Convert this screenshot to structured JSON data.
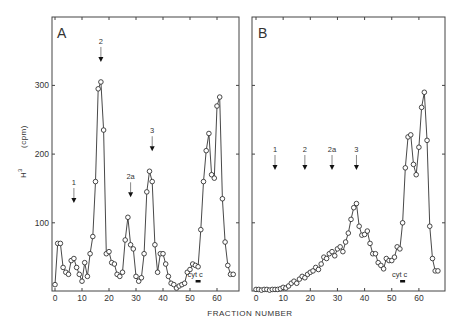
{
  "chart_data": [
    {
      "type": "line",
      "panel": "A",
      "xlabel": "FRACTION NUMBER",
      "ylabel": "H³ (cpm)",
      "xlim": [
        0,
        68.5
      ],
      "ylim": [
        0,
        400
      ],
      "xticks": [
        0,
        10,
        20,
        30,
        40,
        50,
        60
      ],
      "yticks": [
        100,
        200,
        300
      ],
      "grid": false,
      "x": [
        0,
        1,
        2,
        3,
        4,
        5,
        6,
        7,
        8,
        9,
        10,
        11,
        12,
        13,
        14,
        15,
        16,
        17,
        18,
        19,
        20,
        21,
        22,
        23,
        24,
        25,
        26,
        27,
        28,
        29,
        30,
        31,
        32,
        33,
        34,
        35,
        36,
        37,
        38,
        39,
        40,
        41,
        42,
        43,
        44,
        45,
        46,
        47,
        48,
        49,
        50,
        51,
        52,
        53,
        54,
        55,
        56,
        57,
        58,
        59,
        60,
        61,
        62,
        63,
        64,
        65,
        66
      ],
      "values": [
        10,
        70,
        70,
        35,
        28,
        25,
        45,
        48,
        35,
        25,
        15,
        42,
        22,
        55,
        80,
        160,
        295,
        305,
        235,
        55,
        58,
        42,
        40,
        25,
        22,
        28,
        75,
        108,
        68,
        62,
        22,
        15,
        20,
        55,
        145,
        175,
        160,
        68,
        28,
        55,
        55,
        40,
        22,
        12,
        10,
        5,
        8,
        10,
        12,
        28,
        32,
        40,
        38,
        36,
        90,
        160,
        205,
        230,
        170,
        165,
        270,
        283,
        135,
        72,
        38,
        25,
        25
      ],
      "markers": [
        {
          "label": "1",
          "fraction": 7,
          "style": "arrow"
        },
        {
          "label": "2",
          "fraction": 17,
          "style": "arrow"
        },
        {
          "label": "2a",
          "fraction": 28,
          "style": "arrow"
        },
        {
          "label": "3",
          "fraction": 36,
          "style": "arrow"
        },
        {
          "label": "cyt c",
          "fraction": 53,
          "style": "bar"
        }
      ]
    },
    {
      "type": "line",
      "panel": "B",
      "xlabel": "FRACTION NUMBER",
      "ylabel": "H³ (cpm)",
      "xlim": [
        0,
        70
      ],
      "ylim": [
        0,
        400
      ],
      "xticks": [
        0,
        10,
        20,
        30,
        40,
        50,
        60
      ],
      "yticks": [
        100,
        200,
        300
      ],
      "grid": false,
      "x": [
        0,
        1,
        2,
        3,
        4,
        5,
        6,
        7,
        8,
        9,
        10,
        11,
        12,
        13,
        14,
        15,
        16,
        17,
        18,
        19,
        20,
        21,
        22,
        23,
        24,
        25,
        26,
        27,
        28,
        29,
        30,
        31,
        32,
        33,
        34,
        35,
        36,
        37,
        38,
        39,
        40,
        41,
        42,
        43,
        44,
        45,
        46,
        47,
        48,
        49,
        50,
        51,
        52,
        53,
        54,
        55,
        56,
        57,
        58,
        59,
        60,
        61,
        62,
        63,
        64,
        65,
        66,
        67
      ],
      "values": [
        3,
        3,
        2,
        3,
        3,
        2,
        3,
        3,
        3,
        4,
        6,
        5,
        8,
        12,
        15,
        12,
        18,
        22,
        20,
        25,
        28,
        30,
        35,
        32,
        40,
        50,
        48,
        55,
        58,
        52,
        62,
        65,
        58,
        72,
        85,
        105,
        122,
        128,
        95,
        82,
        83,
        88,
        70,
        55,
        55,
        42,
        38,
        33,
        48,
        45,
        45,
        50,
        65,
        62,
        100,
        180,
        225,
        228,
        185,
        170,
        210,
        268,
        290,
        220,
        95,
        48,
        30,
        30
      ],
      "markers": [
        {
          "label": "1",
          "fraction": 7,
          "style": "arrow"
        },
        {
          "label": "2",
          "fraction": 18,
          "style": "arrow"
        },
        {
          "label": "2a",
          "fraction": 28,
          "style": "arrow"
        },
        {
          "label": "3",
          "fraction": 37,
          "style": "arrow"
        },
        {
          "label": "cyt c",
          "fraction": 54,
          "style": "bar"
        }
      ]
    }
  ],
  "labels": {
    "panel_a": "A",
    "panel_b": "B",
    "xlabel": "FRACTION NUMBER",
    "ylabel_main": "H",
    "ylabel_sup": "3",
    "ylabel_unit": "(cpm)",
    "yticks": [
      "100",
      "200",
      "300"
    ],
    "xticks": [
      "0",
      "10",
      "20",
      "30",
      "40",
      "50",
      "60"
    ]
  }
}
